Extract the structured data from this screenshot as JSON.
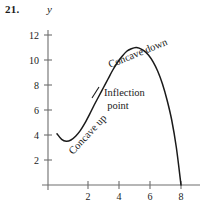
{
  "figure": {
    "problem_number": "21.",
    "y_axis_label": "y"
  },
  "annotations": {
    "concave_up": "Concave up",
    "concave_down": "Concave down",
    "inflection_line1": "Inflection",
    "inflection_line2": "point"
  },
  "axes": {
    "y_ticks": [
      "12",
      "10",
      "8",
      "6",
      "4",
      "2"
    ],
    "x_ticks": [
      "2",
      "4",
      "6",
      "8"
    ]
  },
  "chart_data": {
    "type": "line",
    "title": "",
    "xlabel": "",
    "ylabel": "y",
    "xlim": [
      0,
      8.6
    ],
    "ylim": [
      0,
      13
    ],
    "grid": false,
    "legend": null,
    "x_ticks": [
      2,
      4,
      6,
      8
    ],
    "y_ticks": [
      2,
      4,
      6,
      8,
      10,
      12
    ],
    "series": [
      {
        "name": "curve",
        "x": [
          0.0,
          0.3,
          0.6,
          0.9,
          1.2,
          1.5,
          1.8,
          2.1,
          2.4,
          2.7,
          3.0,
          3.3,
          3.6,
          3.9,
          4.2,
          4.5,
          4.8,
          5.1,
          5.3,
          5.6,
          5.9,
          6.2,
          6.5,
          6.8,
          7.1,
          7.4,
          7.7,
          8.0
        ],
        "y": [
          4.1,
          3.65,
          3.5,
          3.6,
          3.9,
          4.35,
          4.95,
          5.65,
          6.4,
          7.1,
          7.8,
          8.5,
          9.2,
          9.8,
          10.3,
          10.7,
          10.9,
          11.0,
          10.95,
          10.75,
          10.4,
          9.85,
          9.1,
          8.1,
          6.8,
          5.2,
          3.0,
          0.0
        ]
      }
    ],
    "annotations": [
      {
        "text": "Concave up",
        "x": 1.6,
        "y": 4.0,
        "rotation": -47
      },
      {
        "text": "Concave down",
        "x": 4.6,
        "y": 11.7,
        "rotation": -22
      },
      {
        "text": "Inflection point",
        "x": 3.6,
        "y": 7.6,
        "rotation": 0
      },
      {
        "text": "inflection-point-marker",
        "x": 3.0,
        "y": 7.8,
        "rotation": 0
      }
    ],
    "local_minimum": {
      "x": 0.6,
      "y": 3.5
    },
    "local_maximum": {
      "x": 5.2,
      "y": 11.0
    },
    "inflection_point": {
      "x": 3.0,
      "y": 7.8
    },
    "x_intercept": {
      "x": 8.0,
      "y": 0.0
    }
  }
}
